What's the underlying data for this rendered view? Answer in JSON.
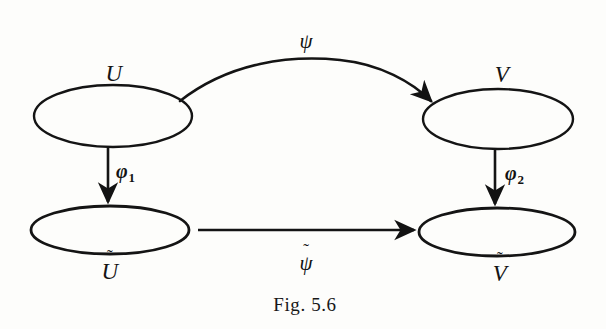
{
  "figure": {
    "caption": "Fig. 5.6",
    "ink_color": "#121212",
    "background_color": "#fdfdfb",
    "nodes": [
      {
        "id": "U",
        "label": "U",
        "tilde": false,
        "label_position": "above",
        "cx": 113,
        "cy": 116,
        "rx": 79,
        "ry": 31
      },
      {
        "id": "V",
        "label": "V",
        "tilde": false,
        "label_position": "above",
        "cx": 498,
        "cy": 119,
        "rx": 75,
        "ry": 30
      },
      {
        "id": "Ut",
        "label": "U",
        "tilde": true,
        "label_position": "below",
        "cx": 110,
        "cy": 230,
        "rx": 79,
        "ry": 24
      },
      {
        "id": "Vt",
        "label": "V",
        "tilde": true,
        "label_position": "below",
        "cx": 497,
        "cy": 232,
        "rx": 78,
        "ry": 24
      }
    ],
    "arrows": [
      {
        "id": "psi",
        "label": "ψ",
        "tilde": false,
        "from": "U",
        "to": "V",
        "shape": "curved",
        "label_position": "above"
      },
      {
        "id": "phi1",
        "label": "φ",
        "subscript": "1",
        "tilde": false,
        "from": "U",
        "to": "Ut",
        "shape": "vertical",
        "label_position": "right"
      },
      {
        "id": "phi2",
        "label": "φ",
        "subscript": "2",
        "tilde": false,
        "from": "V",
        "to": "Vt",
        "shape": "vertical",
        "label_position": "right"
      },
      {
        "id": "psi-tilde",
        "label": "ψ",
        "tilde": true,
        "from": "Ut",
        "to": "Vt",
        "shape": "horizontal",
        "label_position": "below"
      }
    ]
  },
  "labels": {
    "u": "U",
    "v": "V",
    "u_tilde_base": "U",
    "v_tilde_base": "V",
    "tilde_mark": "˜",
    "psi": "ψ",
    "psi_tilde_base": "ψ",
    "phi": "φ",
    "phi1_sub": "1",
    "phi2_sub": "2",
    "caption": "Fig. 5.6"
  }
}
